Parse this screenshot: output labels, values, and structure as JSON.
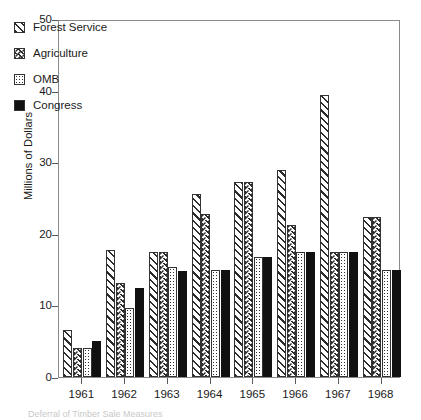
{
  "chart_data": {
    "type": "bar",
    "title": "",
    "xlabel": "",
    "ylabel": "Millions of Dollars",
    "categories": [
      "1961",
      "1962",
      "1963",
      "1964",
      "1965",
      "1966",
      "1967",
      "1968"
    ],
    "ylim": [
      0,
      50
    ],
    "yticks": [
      0,
      10,
      20,
      30,
      40,
      50
    ],
    "grid": false,
    "legend_position": "upper-left",
    "series": [
      {
        "name": "Forest Service",
        "pattern": "diagonal-hatch",
        "values": [
          6.5,
          17.7,
          17.5,
          25.5,
          27.3,
          28.9,
          39.4,
          22.4
        ]
      },
      {
        "name": "Agriculture",
        "pattern": "chevron-hatch",
        "values": [
          4.0,
          13.2,
          17.5,
          22.8,
          27.3,
          21.2,
          17.5,
          22.4
        ]
      },
      {
        "name": "OMB",
        "pattern": "dotted",
        "values": [
          4.0,
          9.7,
          15.3,
          15.0,
          16.8,
          17.5,
          17.5,
          14.9
        ]
      },
      {
        "name": "Congress",
        "pattern": "solid-black",
        "values": [
          5.0,
          12.4,
          14.8,
          15.0,
          16.8,
          17.5,
          17.5,
          14.9
        ]
      }
    ]
  },
  "legend": {
    "items": [
      {
        "label": "Forest Service",
        "swatch": "diagonal-hatch-swatch"
      },
      {
        "label": "Agriculture",
        "swatch": "chevron-hatch-swatch"
      },
      {
        "label": "OMB",
        "swatch": "dotted-swatch"
      },
      {
        "label": "Congress",
        "swatch": "solid-black-swatch"
      }
    ]
  },
  "axis": {
    "y_title": "Millions of Dollars",
    "y_tick_labels": [
      "50",
      "40",
      "30",
      "20",
      "10",
      "0"
    ],
    "x_tick_labels": [
      "1961",
      "1962",
      "1963",
      "1964",
      "1965",
      "1966",
      "1967",
      "1968"
    ]
  },
  "caption": {
    "text": "Deferral of Timber Sale Measures"
  },
  "colors": {
    "ink": "#1a1a1a",
    "frame": "#8a8a8a",
    "bar_outline": "#333333",
    "solid_series": "#111111",
    "background": "#ffffff"
  }
}
